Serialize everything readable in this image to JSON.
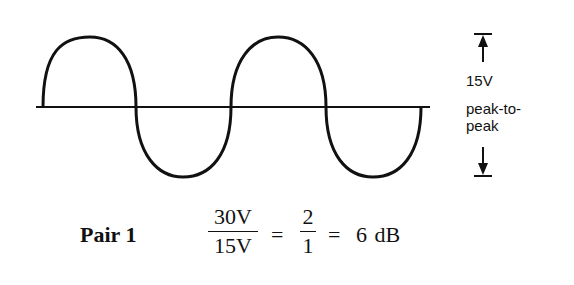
{
  "diagram": {
    "waveform": {
      "type": "sine",
      "cycles": 2,
      "baseline_y": 107,
      "x_start": 43,
      "zero_crossings_x": [
        136,
        231,
        326
      ],
      "x_end": 421,
      "peak_y": 37,
      "trough_y": 177,
      "stroke_color": "#111111"
    },
    "amplitude_annotation": {
      "value": "15V",
      "line2": "peak-to-",
      "line3": "peak",
      "arrow_icon_top": "arrow-up-to-bar",
      "arrow_icon_bottom": "arrow-down-to-bar"
    },
    "equation": {
      "label": "Pair 1",
      "fraction1": {
        "numerator": "30V",
        "denominator": "15V"
      },
      "equals1": "=",
      "fraction2": {
        "numerator": "2",
        "denominator": "1"
      },
      "equals2": "=",
      "result": "6 dB"
    }
  }
}
